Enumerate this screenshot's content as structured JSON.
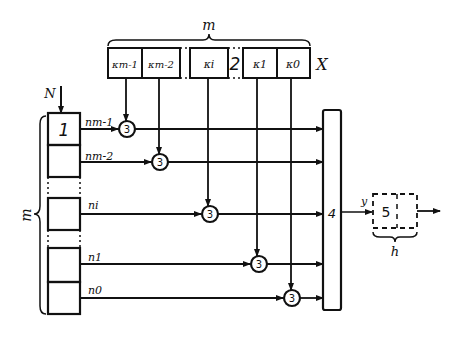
{
  "diagram": {
    "register_x": {
      "label": "X",
      "brace_label": "m",
      "separator_label": "2",
      "cells": [
        "k_{m-1}",
        "k_{m-2}",
        "k_i",
        "k_1",
        "k_0"
      ],
      "cells_display": [
        "κm-1",
        "κm-2",
        "κi",
        "κ1",
        "κ0"
      ]
    },
    "register_n": {
      "input_label": "N",
      "brace_label": "m",
      "block_number": "1",
      "outputs": [
        "n_{m-1}",
        "n_{m-2}",
        "n_i",
        "n_1",
        "n_0"
      ],
      "outputs_display": [
        "nm-1",
        "nm-2",
        "ni",
        "n1",
        "n0"
      ]
    },
    "multipliers": {
      "label": "3",
      "count": 5
    },
    "adder": {
      "label": "4",
      "output_label": "y"
    },
    "output_block": {
      "label": "5",
      "brace_label": "h"
    }
  }
}
